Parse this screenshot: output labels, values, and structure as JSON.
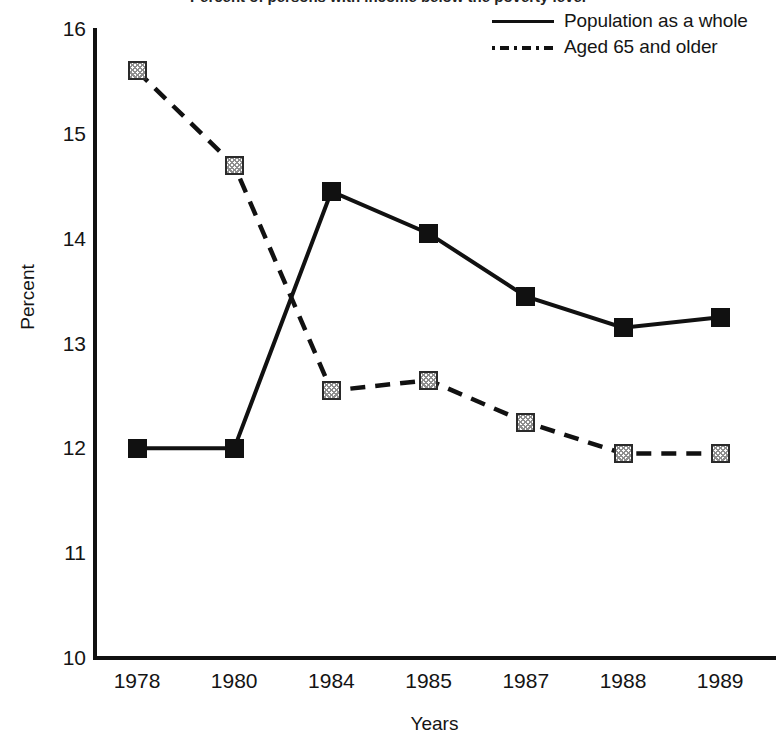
{
  "figure": {
    "title_cutoff": "Percent of persons with income below the poverty level",
    "legend": [
      {
        "label": "Population as a whole",
        "style": "solid",
        "marker": "filled-square",
        "color": "#111111"
      },
      {
        "label": "Aged 65 and older",
        "style": "dashed",
        "marker": "hatched-square",
        "color": "#111111"
      }
    ]
  },
  "chart_data": {
    "type": "line",
    "title": "Percent of persons with income below the poverty level",
    "xlabel": "Years",
    "ylabel": "Percent",
    "categories": [
      "1978",
      "1980",
      "1984",
      "1985",
      "1987",
      "1988",
      "1989"
    ],
    "ylim": [
      10,
      16
    ],
    "yticks": [
      "10",
      "11",
      "12",
      "13",
      "14",
      "15",
      "16"
    ],
    "grid": false,
    "legend_position": "top-right",
    "series": [
      {
        "name": "Population as a whole",
        "style": "solid",
        "marker": "filled-square",
        "values": [
          12.0,
          12.0,
          14.45,
          14.05,
          13.45,
          13.15,
          13.25
        ]
      },
      {
        "name": "Aged 65 and older",
        "style": "dashed",
        "marker": "hatched-square",
        "values": [
          15.6,
          14.7,
          12.55,
          12.65,
          12.25,
          11.95,
          11.95
        ]
      }
    ]
  }
}
